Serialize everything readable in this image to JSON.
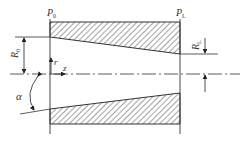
{
  "diagram": {
    "labels": {
      "p0": "P",
      "p0_sub": "0",
      "pL": "P",
      "pL_sub": "L",
      "r0": "R",
      "r0_sub": "0",
      "rL": "R",
      "rL_sub": "L",
      "r_axis": "r",
      "z_axis": "z",
      "alpha": "α"
    },
    "colors": {
      "line": "#333333",
      "hatch": "#555555",
      "background": "#ffffff"
    }
  }
}
